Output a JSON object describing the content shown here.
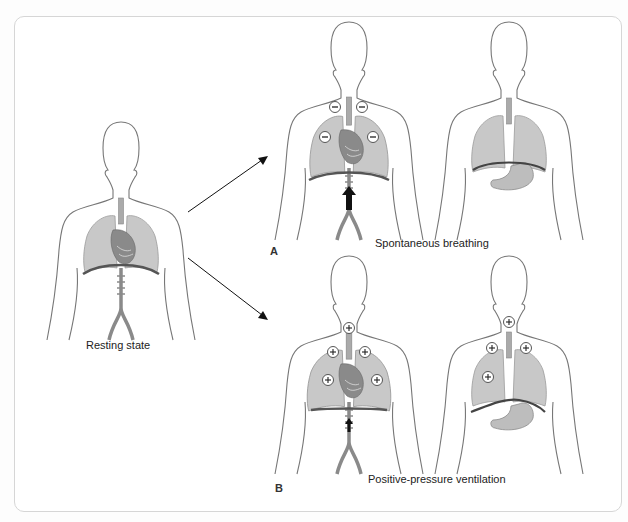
{
  "figure": {
    "labels": {
      "resting": "Resting state",
      "panel_a_caption": "Spontaneous breathing",
      "panel_b_caption": "Positive-pressure ventilation",
      "panel_a_letter": "A",
      "panel_b_letter": "B"
    },
    "symbols": {
      "negative": "−",
      "positive": "+"
    },
    "colors": {
      "outline": "#777777",
      "lung": "#c8c8c8",
      "lung_stroke": "#9a9a9a",
      "heart": "#7d7d7d",
      "diaphragm": "#555555",
      "vessel": "#8a8a8a",
      "arrow": "#111111"
    },
    "figures": [
      {
        "id": "resting",
        "pressure_markers": []
      },
      {
        "id": "a-inspiration",
        "pressure_markers": [
          "−",
          "−",
          "−",
          "−"
        ],
        "arrow": "up-large"
      },
      {
        "id": "a-expiration-view",
        "pressure_markers": []
      },
      {
        "id": "b-inspiration",
        "pressure_markers": [
          "+",
          "+",
          "+",
          "+",
          "+"
        ],
        "arrow": "up-small"
      },
      {
        "id": "b-expiration-view",
        "pressure_markers": [
          "+",
          "+",
          "+",
          "+"
        ]
      }
    ]
  }
}
